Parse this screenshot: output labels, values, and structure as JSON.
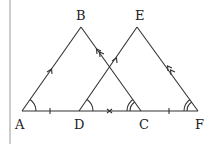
{
  "diagram": {
    "points": {
      "A": {
        "label": "A",
        "x": 22,
        "y": 111
      },
      "B": {
        "label": "B",
        "x": 81,
        "y": 27
      },
      "C": {
        "label": "C",
        "x": 141,
        "y": 111
      },
      "D": {
        "label": "D",
        "x": 79,
        "y": 111
      },
      "E": {
        "label": "E",
        "x": 137,
        "y": 27
      },
      "F": {
        "label": "F",
        "x": 198,
        "y": 111
      }
    },
    "labels": [
      "A",
      "B",
      "C",
      "D",
      "E",
      "F"
    ],
    "segments": [
      "AB",
      "BC",
      "DE",
      "EF",
      "AF"
    ],
    "markings": {
      "AB_DE": "single arrow (parallel)",
      "BC_EF": "double arrow (parallel)",
      "AD_CF": "single tick (equal)",
      "DC": "cross mark",
      "angle_A_D": "single arc",
      "angle_C_F": "double arc"
    }
  }
}
